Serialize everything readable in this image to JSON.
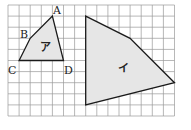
{
  "grid": {
    "cols": 15,
    "rows": 10,
    "origin_x": 8,
    "origin_y": 5,
    "cell": 11.1,
    "line_color": "#9a9a9a"
  },
  "shapes": [
    {
      "name": "ア",
      "fill": "#e6e6e6",
      "vertices": [
        {
          "label": "A",
          "x": 4,
          "y": 1
        },
        {
          "label": "D",
          "x": 5,
          "y": 5
        },
        {
          "label": "C",
          "x": 1,
          "y": 5
        },
        {
          "label": "B",
          "x": 2,
          "y": 3
        }
      ]
    },
    {
      "name": "イ",
      "fill": "#e6e6e6",
      "vertices": [
        {
          "x": 7,
          "y": 1
        },
        {
          "x": 11,
          "y": 3
        },
        {
          "x": 15,
          "y": 7
        },
        {
          "x": 7,
          "y": 9
        }
      ]
    }
  ],
  "labels": {
    "A": "A",
    "B": "B",
    "C": "C",
    "D": "D",
    "shape1": "ア",
    "shape2": "イ"
  }
}
